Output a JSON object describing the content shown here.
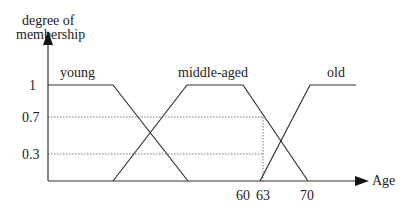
{
  "diagram": {
    "y_axis_label_line1": "degree of",
    "y_axis_label_line2": "membership",
    "x_axis_label": "Age",
    "y_ticks": [
      "1",
      "0.7",
      "0.3"
    ],
    "x_ticks": [
      "60",
      "63",
      "70"
    ],
    "sets": [
      {
        "name": "young",
        "shape": "trapezoid"
      },
      {
        "name": "middle-aged",
        "shape": "trapezoid"
      },
      {
        "name": "old",
        "shape": "trapezoid"
      }
    ],
    "annotation": {
      "age": "63",
      "membership_middle_aged": "0.7",
      "membership_old": "0.3"
    },
    "colors": {
      "line": "#333333",
      "dotted": "#777777"
    }
  }
}
